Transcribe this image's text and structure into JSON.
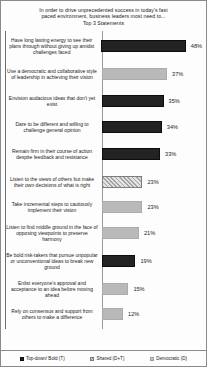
{
  "chart_data": {
    "type": "bar",
    "orientation": "horizontal",
    "title": "In order to drive unprecedented success in today's fast paced environment, business leaders most need to... Top 3 Statements",
    "title_lines": [
      "In order to drive unprecedented success in today's fast",
      "paced environment, business leaders most need to...",
      "Top 3 Statements"
    ],
    "xlabel": "",
    "ylabel": "",
    "grid": false,
    "xlim": [
      0,
      50
    ],
    "value_suffix": "%",
    "legend_position": "bottom",
    "legend": [
      {
        "key": "T",
        "label": "Top-down/ Bold (T)",
        "color": "#232323",
        "pattern": "solid"
      },
      {
        "key": "D+T",
        "label": "Shared (D+T)",
        "color": "#a4a4a4",
        "pattern": "hatched"
      },
      {
        "key": "D",
        "label": "Democratic (D)",
        "color": "#b9b9b9",
        "pattern": "solid"
      }
    ],
    "categories": [
      "Have long lasting energy to see their plans through without giving up amidst challenges faced",
      "Use a democratic and collaborative style of leadership  in achieving their vision",
      "Envision audacious ideas that don't yet exist",
      "Dare to be different and willing to challenge  general opinion",
      "Remain firm in their course of action despite feedback and resistance",
      "Listen to the views of others but make their own decisions of what is right",
      "Take incremental steps to cautiously implement their vision",
      "Listen to find middle ground in the face of opposing viewpoints  to preserve harmony",
      "Be bold risk-takers  that pursue unpopular or unconventional ideas to break new ground",
      "Enlist everyone's approval and acceptance to an idea before moving ahead",
      "Rely on consensus and support from others to make a difference"
    ],
    "values": [
      48,
      37,
      35,
      34,
      33,
      23,
      23,
      21,
      19,
      15,
      12
    ],
    "value_labels": [
      "48%",
      "37%",
      "35%",
      "34%",
      "33%",
      "23%",
      "23%",
      "21%",
      "19%",
      "15%",
      "12%"
    ],
    "series_keys": [
      "T",
      "D",
      "T",
      "T",
      "T",
      "D+T",
      "D",
      "D",
      "T",
      "D",
      "D"
    ]
  },
  "rows": [
    {
      "label": "Have long lasting energy to see their plans through without giving up amidst challenges faced",
      "value_label": "48%",
      "pct": 48,
      "series": "t"
    },
    {
      "label": "Use a democratic and collaborative style of leadership  in achieving their vision",
      "value_label": "37%",
      "pct": 37,
      "series": "d"
    },
    {
      "label": "Envision audacious ideas that don't yet exist",
      "value_label": "35%",
      "pct": 35,
      "series": "t"
    },
    {
      "label": "Dare to be different and willing to challenge  general opinion",
      "value_label": "34%",
      "pct": 34,
      "series": "t"
    },
    {
      "label": "Remain firm in their course of action despite feedback and resistance",
      "value_label": "33%",
      "pct": 33,
      "series": "t"
    },
    {
      "label": "Listen to the views of others but make their own decisions of what is right",
      "value_label": "23%",
      "pct": 23,
      "series": "dt"
    },
    {
      "label": "Take incremental steps to cautiously implement their vision",
      "value_label": "23%",
      "pct": 23,
      "series": "d"
    },
    {
      "label": "Listen to find middle ground in the face of opposing viewpoints  to preserve harmony",
      "value_label": "21%",
      "pct": 21,
      "series": "d"
    },
    {
      "label": "Be bold risk-takers  that pursue unpopular or unconventional ideas to break new ground",
      "value_label": "19%",
      "pct": 19,
      "series": "t"
    },
    {
      "label": "Enlist everyone's approval and acceptance to an idea before moving ahead",
      "value_label": "15%",
      "pct": 15,
      "series": "d"
    },
    {
      "label": "Rely on consensus and support from others to make a difference",
      "value_label": "12%",
      "pct": 12,
      "series": "d"
    }
  ],
  "row_heights": [
    29,
    28,
    26,
    26,
    28,
    27,
    24,
    28,
    28,
    27,
    24
  ]
}
